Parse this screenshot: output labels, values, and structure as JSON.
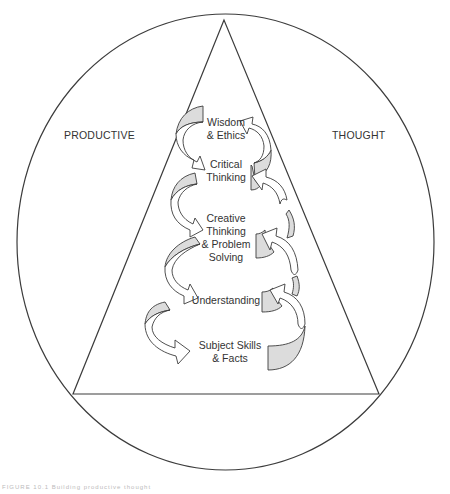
{
  "diagram": {
    "side_labels": {
      "left": "PRODUCTIVE",
      "right": "THOUGHT"
    },
    "levels": [
      {
        "line1": "Wisdom",
        "line2": "& Ethics"
      },
      {
        "line1": "Critical",
        "line2": "Thinking"
      },
      {
        "line1": "Creative",
        "line2": "Thinking",
        "line3": "& Problem",
        "line4": "Solving"
      },
      {
        "line1": "Understanding"
      },
      {
        "line1": "Subject Skills",
        "line2": "& Facts"
      }
    ],
    "shapes": {
      "outer": "ellipse",
      "inner": "triangle",
      "connectors": "spiral curved arrows"
    },
    "colors": {
      "stroke": "#3c3c3c",
      "arrow_fill": "#ffffff",
      "arrow_shade": "#dcdcdc"
    }
  },
  "caption": "FIGURE 10.1  Building productive thought"
}
